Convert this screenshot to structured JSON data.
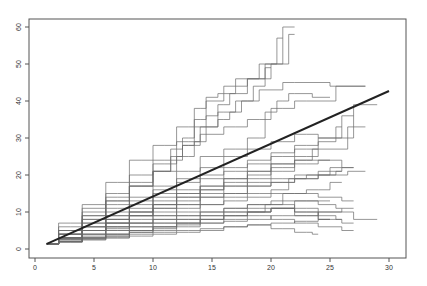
{
  "chart_data": {
    "type": "line",
    "title": "",
    "xlabel": "",
    "ylabel": "",
    "xlim": [
      0,
      31
    ],
    "ylim": [
      -2,
      62
    ],
    "x_ticks": [
      0,
      5,
      10,
      15,
      20,
      25,
      30
    ],
    "y_ticks": [
      0,
      10,
      20,
      30,
      40,
      50,
      60
    ],
    "grid": false,
    "legend": null,
    "colors": {
      "series": "#6a6a6a",
      "mean": "#222222",
      "axis": "#555555"
    },
    "mean_line": {
      "name": "mean",
      "x": [
        1,
        30
      ],
      "y": [
        1.4,
        42.7
      ]
    },
    "series": [
      {
        "name": "s1",
        "x": [
          1,
          3,
          5,
          7,
          9,
          11,
          13,
          15,
          16,
          17,
          18,
          19,
          20,
          22
        ],
        "y": [
          1.4,
          5,
          9,
          14,
          18,
          23,
          29,
          33,
          35,
          37,
          40,
          44,
          50,
          60
        ]
      },
      {
        "name": "s2",
        "x": [
          1,
          3,
          5,
          7,
          9,
          11,
          12,
          13,
          14,
          15,
          17,
          19,
          21,
          22
        ],
        "y": [
          1.4,
          6,
          11,
          15,
          20,
          24,
          27,
          30,
          35,
          40,
          44,
          46,
          50,
          58
        ]
      },
      {
        "name": "s3",
        "x": [
          1,
          3,
          5,
          7,
          9,
          11,
          13,
          14,
          15,
          16,
          18,
          20,
          21
        ],
        "y": [
          1.4,
          7,
          12,
          18,
          24,
          28,
          33,
          38,
          41,
          42,
          46,
          50,
          57
        ]
      },
      {
        "name": "s4",
        "x": [
          1,
          3,
          5,
          7,
          9,
          11,
          13,
          14,
          15,
          16,
          18,
          20,
          22,
          28
        ],
        "y": [
          1.4,
          5,
          10,
          13,
          17,
          21,
          25,
          29,
          33,
          37,
          40,
          43,
          45,
          44
        ]
      },
      {
        "name": "s5",
        "x": [
          1,
          3,
          5,
          7,
          9,
          11,
          13,
          15,
          17,
          19,
          20,
          21,
          22,
          25
        ],
        "y": [
          1.4,
          4,
          8,
          11,
          14,
          17,
          21,
          25,
          27,
          30,
          37,
          40,
          42,
          41
        ]
      },
      {
        "name": "s6",
        "x": [
          1,
          3,
          5,
          7,
          9,
          11,
          12,
          13,
          15,
          17,
          19,
          21,
          23,
          28
        ],
        "y": [
          1.4,
          5,
          9,
          13,
          17,
          21,
          25,
          28,
          31,
          33,
          35,
          38,
          40,
          44
        ]
      },
      {
        "name": "s7",
        "x": [
          1,
          3,
          5,
          7,
          9,
          11,
          13,
          15,
          17,
          19,
          21,
          23,
          25,
          29
        ],
        "y": [
          1.4,
          4,
          7,
          10,
          13,
          16,
          19,
          22,
          25,
          27,
          29,
          31,
          30,
          39
        ]
      },
      {
        "name": "s8",
        "x": [
          1,
          3,
          5,
          7,
          9,
          11,
          13,
          15,
          17,
          19,
          21,
          23,
          25,
          27
        ],
        "y": [
          1.4,
          4,
          7,
          9,
          12,
          15,
          18,
          20,
          22,
          24,
          26,
          28,
          30,
          36
        ]
      },
      {
        "name": "s9",
        "x": [
          1,
          3,
          5,
          7,
          9,
          11,
          13,
          15,
          17,
          19,
          21,
          23,
          25,
          26
        ],
        "y": [
          1.4,
          4,
          6,
          9,
          11,
          14,
          16,
          19,
          21,
          23,
          25,
          27,
          29,
          33
        ]
      },
      {
        "name": "s10",
        "x": [
          1,
          3,
          5,
          7,
          9,
          11,
          13,
          15,
          17,
          19,
          21,
          23,
          25,
          28
        ],
        "y": [
          1.4,
          3,
          6,
          8,
          10,
          13,
          15,
          17,
          19,
          21,
          23,
          25,
          27,
          33
        ]
      },
      {
        "name": "s11",
        "x": [
          1,
          3,
          5,
          7,
          9,
          11,
          13,
          15,
          17,
          19,
          21,
          23,
          25,
          27
        ],
        "y": [
          1.4,
          3,
          6,
          8,
          10,
          12,
          15,
          17,
          19,
          21,
          23,
          24,
          24,
          22
        ]
      },
      {
        "name": "s12",
        "x": [
          1,
          3,
          5,
          7,
          9,
          11,
          13,
          15,
          17,
          19,
          21,
          23,
          25
        ],
        "y": [
          1.4,
          3,
          5,
          8,
          10,
          12,
          14,
          16,
          18,
          20,
          22,
          23,
          24
        ]
      },
      {
        "name": "s13",
        "x": [
          1,
          3,
          5,
          7,
          9,
          11,
          13,
          15,
          17,
          19,
          21,
          23,
          24
        ],
        "y": [
          1.4,
          3,
          5,
          7,
          9,
          11,
          13,
          15,
          17,
          19,
          21,
          24,
          27
        ]
      },
      {
        "name": "s14",
        "x": [
          1,
          3,
          5,
          7,
          9,
          11,
          13,
          15,
          17,
          19,
          21,
          23,
          25,
          26
        ],
        "y": [
          1.4,
          3,
          5,
          7,
          9,
          10,
          12,
          14,
          15,
          17,
          18,
          19,
          20,
          21
        ]
      },
      {
        "name": "s15",
        "x": [
          1,
          3,
          5,
          7,
          9,
          11,
          13,
          15,
          17,
          19,
          21,
          22,
          24,
          26
        ],
        "y": [
          1.4,
          3,
          5,
          6,
          8,
          9,
          11,
          12,
          14,
          15,
          16,
          19,
          20,
          22
        ]
      },
      {
        "name": "s16",
        "x": [
          1,
          3,
          5,
          7,
          9,
          11,
          13,
          15,
          17,
          19,
          21,
          23,
          25,
          27
        ],
        "y": [
          1.4,
          3,
          4,
          6,
          7,
          9,
          10,
          12,
          13,
          14,
          15,
          15,
          14,
          13
        ]
      },
      {
        "name": "s17",
        "x": [
          1,
          3,
          5,
          7,
          9,
          11,
          13,
          15,
          17,
          19,
          21,
          23,
          25,
          29
        ],
        "y": [
          1.4,
          2.5,
          4,
          5.5,
          7,
          8,
          9,
          10,
          11,
          12,
          12,
          11,
          10,
          8
        ]
      },
      {
        "name": "s18",
        "x": [
          1,
          3,
          5,
          7,
          9,
          11,
          13,
          15,
          17,
          19,
          21,
          23,
          25,
          27
        ],
        "y": [
          1.4,
          2.5,
          4,
          5,
          6,
          7,
          8,
          9,
          10,
          11,
          11,
          10,
          8,
          7
        ]
      },
      {
        "name": "s19",
        "x": [
          1,
          3,
          5,
          7,
          9,
          11,
          13,
          15,
          17,
          19,
          21,
          23,
          25,
          26
        ],
        "y": [
          1.4,
          2.5,
          3.5,
          5,
          6,
          7,
          8,
          9,
          10,
          10,
          11,
          10,
          9,
          8
        ]
      },
      {
        "name": "s20",
        "x": [
          1,
          3,
          5,
          7,
          9,
          11,
          13,
          15,
          17,
          19,
          21,
          23,
          25
        ],
        "y": [
          1.4,
          2,
          3,
          4,
          5,
          6,
          7,
          8,
          9,
          10,
          11,
          13,
          13
        ]
      },
      {
        "name": "s21",
        "x": [
          1,
          3,
          5,
          7,
          9,
          11,
          13,
          15,
          17,
          19,
          20,
          22,
          24,
          26
        ],
        "y": [
          1.4,
          2,
          3,
          4,
          5,
          6,
          7,
          8,
          9,
          10,
          12,
          15,
          16,
          18
        ]
      },
      {
        "name": "s22",
        "x": [
          1,
          3,
          5,
          7,
          9,
          11,
          13,
          15,
          17,
          19,
          21,
          23,
          25
        ],
        "y": [
          1.4,
          2,
          3,
          3.5,
          4.5,
          5.5,
          6.5,
          8,
          9,
          10,
          11,
          9,
          8
        ]
      },
      {
        "name": "s23",
        "x": [
          1,
          3,
          5,
          7,
          9,
          11,
          13,
          15,
          17,
          19,
          21,
          23,
          25,
          27
        ],
        "y": [
          1.4,
          2,
          2.8,
          3.5,
          4.5,
          5,
          6,
          7,
          7.5,
          8,
          9,
          9,
          10,
          11
        ]
      },
      {
        "name": "s24",
        "x": [
          1,
          3,
          5,
          7,
          9,
          11,
          13,
          15,
          17,
          19,
          21,
          23,
          24
        ],
        "y": [
          1.4,
          2,
          2.5,
          3,
          4,
          4.5,
          5,
          5.5,
          6,
          6.5,
          5.5,
          4.5,
          4
        ]
      },
      {
        "name": "s25",
        "x": [
          1,
          3,
          5,
          7,
          9,
          11,
          13,
          15,
          17,
          19,
          21,
          23,
          25
        ],
        "y": [
          1.4,
          1.8,
          2.5,
          3,
          3.5,
          4,
          4.5,
          5,
          6,
          6.5,
          7,
          7.5,
          8
        ]
      },
      {
        "name": "s26",
        "x": [
          1,
          3,
          5,
          7,
          9,
          11,
          12,
          13,
          14,
          15,
          16,
          17,
          19,
          20
        ],
        "y": [
          1.4,
          4,
          8,
          12,
          17,
          21,
          24,
          28,
          33,
          36,
          39,
          42,
          46,
          49
        ]
      },
      {
        "name": "s27",
        "x": [
          1,
          3,
          5,
          7,
          9,
          11,
          13,
          15,
          17,
          19,
          21,
          23,
          25,
          27
        ],
        "y": [
          1.4,
          3,
          5,
          7,
          9,
          11,
          12,
          14,
          15,
          17,
          18,
          19,
          21,
          22
        ]
      },
      {
        "name": "s28",
        "x": [
          1,
          3,
          5,
          7,
          9,
          11,
          13,
          15,
          17,
          19,
          21,
          23,
          25,
          26
        ],
        "y": [
          1.4,
          3,
          5,
          6,
          7,
          8,
          9,
          10,
          11,
          12,
          13,
          13,
          12,
          11
        ]
      },
      {
        "name": "s29",
        "x": [
          1,
          3,
          5,
          7,
          9,
          11,
          13,
          15,
          17,
          19,
          21,
          23,
          25,
          27
        ],
        "y": [
          1.4,
          2,
          3,
          4,
          5,
          6,
          7,
          7,
          8,
          9,
          8,
          7,
          6,
          5
        ]
      },
      {
        "name": "s30",
        "x": [
          1,
          3,
          5,
          7,
          9,
          11,
          13,
          15,
          17,
          19,
          21,
          23,
          25,
          28
        ],
        "y": [
          1.4,
          3,
          5,
          7,
          9,
          12,
          14,
          16,
          17,
          18,
          19,
          20,
          20,
          21
        ]
      }
    ]
  }
}
